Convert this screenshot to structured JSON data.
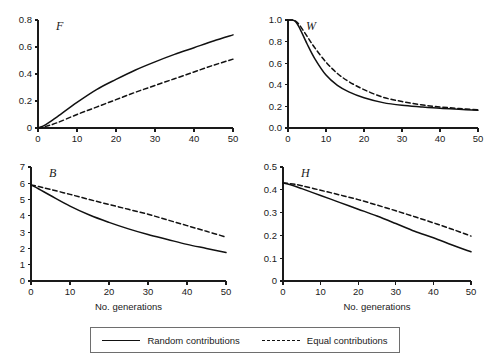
{
  "figure": {
    "background": "#ffffff",
    "line_color": "#111111",
    "axis_color": "#1a1a1a",
    "x_axis_title": "No. generations"
  },
  "legend": {
    "position": "bottom-center",
    "entries": [
      {
        "label": "Random contributions",
        "style": "solid"
      },
      {
        "label": "Equal contributions",
        "style": "dashed"
      }
    ]
  },
  "chart_data": [
    {
      "id": "panel-F",
      "type": "line",
      "title": "F",
      "xlabel": "",
      "ylabel": "",
      "xlim": [
        0,
        50
      ],
      "ylim": [
        0,
        0.8
      ],
      "xticks": [
        0,
        10,
        20,
        30,
        40,
        50
      ],
      "xticklabels": [
        "0",
        "10",
        "20",
        "30",
        "40",
        "50"
      ],
      "yticks": [
        0,
        0.2,
        0.4,
        0.6,
        0.8
      ],
      "yticklabels": [
        "0",
        "0.2",
        "0.4",
        "0.6",
        "0.8"
      ],
      "grid": false,
      "x": [
        0,
        2,
        5,
        10,
        15,
        20,
        25,
        30,
        35,
        40,
        45,
        50
      ],
      "series": [
        {
          "name": "Random contributions",
          "style": "solid",
          "values": [
            0.0,
            0.025,
            0.085,
            0.19,
            0.285,
            0.36,
            0.43,
            0.49,
            0.545,
            0.595,
            0.645,
            0.69
          ]
        },
        {
          "name": "Equal contributions",
          "style": "dashed",
          "values": [
            0.0,
            0.012,
            0.04,
            0.1,
            0.155,
            0.21,
            0.265,
            0.315,
            0.365,
            0.415,
            0.465,
            0.51
          ]
        }
      ]
    },
    {
      "id": "panel-W",
      "type": "line",
      "title": "W",
      "xlabel": "",
      "ylabel": "",
      "xlim": [
        0,
        50
      ],
      "ylim": [
        0,
        1.0
      ],
      "xticks": [
        0,
        10,
        20,
        30,
        40,
        50
      ],
      "xticklabels": [
        "0",
        "10",
        "20",
        "30",
        "40",
        "50"
      ],
      "yticks": [
        0.0,
        0.2,
        0.4,
        0.6,
        0.8,
        1.0
      ],
      "yticklabels": [
        "0.0",
        "0.2",
        "0.4",
        "0.6",
        "0.8",
        "1.0"
      ],
      "grid": false,
      "x": [
        0,
        1,
        2,
        3,
        5,
        7,
        10,
        13,
        16,
        20,
        25,
        30,
        35,
        40,
        45,
        50
      ],
      "series": [
        {
          "name": "Random contributions",
          "style": "solid",
          "values": [
            1.0,
            1.0,
            0.985,
            0.93,
            0.78,
            0.645,
            0.49,
            0.395,
            0.335,
            0.28,
            0.235,
            0.21,
            0.195,
            0.182,
            0.173,
            0.165
          ]
        },
        {
          "name": "Equal contributions",
          "style": "dashed",
          "values": [
            1.0,
            1.0,
            0.99,
            0.955,
            0.85,
            0.745,
            0.61,
            0.505,
            0.43,
            0.355,
            0.285,
            0.245,
            0.215,
            0.195,
            0.18,
            0.168
          ]
        }
      ]
    },
    {
      "id": "panel-B",
      "type": "line",
      "title": "B",
      "xlabel": "No. generations",
      "ylabel": "",
      "xlim": [
        0,
        50
      ],
      "ylim": [
        0,
        7
      ],
      "xticks": [
        0,
        10,
        20,
        30,
        40,
        50
      ],
      "xticklabels": [
        "0",
        "10",
        "20",
        "30",
        "40",
        "50"
      ],
      "yticks": [
        0,
        1,
        2,
        3,
        4,
        5,
        6,
        7
      ],
      "yticklabels": [
        "0",
        "1",
        "2",
        "3",
        "4",
        "5",
        "6",
        "7"
      ],
      "grid": false,
      "x": [
        0,
        2,
        5,
        10,
        15,
        20,
        25,
        30,
        35,
        40,
        45,
        50
      ],
      "series": [
        {
          "name": "Random contributions",
          "style": "solid",
          "values": [
            5.9,
            5.65,
            5.25,
            4.6,
            4.05,
            3.6,
            3.2,
            2.85,
            2.55,
            2.25,
            2.0,
            1.75
          ]
        },
        {
          "name": "Equal contributions",
          "style": "dashed",
          "values": [
            5.9,
            5.8,
            5.62,
            5.32,
            5.0,
            4.7,
            4.4,
            4.1,
            3.75,
            3.4,
            3.05,
            2.7
          ]
        }
      ]
    },
    {
      "id": "panel-H",
      "type": "line",
      "title": "H",
      "xlabel": "No. generations",
      "ylabel": "",
      "xlim": [
        0,
        50
      ],
      "ylim": [
        0,
        0.5
      ],
      "xticks": [
        0,
        10,
        20,
        30,
        40,
        50
      ],
      "xticklabels": [
        "0",
        "10",
        "20",
        "30",
        "40",
        "50"
      ],
      "yticks": [
        0,
        0.1,
        0.2,
        0.3,
        0.4,
        0.5
      ],
      "yticklabels": [
        "0",
        "0.1",
        "0.2",
        "0.3",
        "0.4",
        "0.5"
      ],
      "grid": false,
      "x": [
        0,
        2,
        5,
        10,
        15,
        20,
        25,
        30,
        35,
        40,
        45,
        50
      ],
      "series": [
        {
          "name": "Random contributions",
          "style": "solid",
          "values": [
            0.43,
            0.422,
            0.405,
            0.375,
            0.345,
            0.315,
            0.285,
            0.252,
            0.218,
            0.19,
            0.158,
            0.128
          ]
        },
        {
          "name": "Equal contributions",
          "style": "dashed",
          "values": [
            0.43,
            0.427,
            0.418,
            0.398,
            0.378,
            0.357,
            0.333,
            0.308,
            0.282,
            0.255,
            0.227,
            0.197
          ]
        }
      ]
    }
  ]
}
